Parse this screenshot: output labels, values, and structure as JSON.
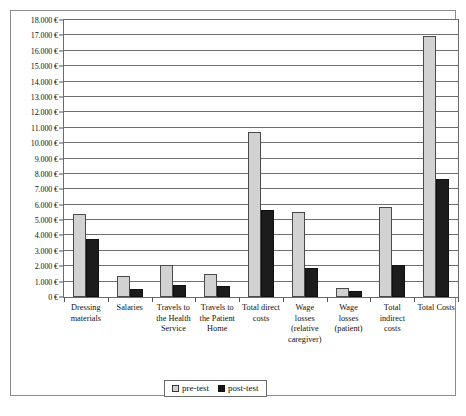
{
  "chart_data": {
    "type": "bar",
    "title": "",
    "xlabel": "",
    "ylabel": "",
    "ylim": [
      0,
      18000
    ],
    "ytick_step": 1000,
    "currency_symbol": "€",
    "grid": true,
    "legend_position": "bottom",
    "categories": [
      "Dressing\nmaterials",
      "Salaries",
      "Travels to\nthe Health\nService",
      "Travels to\nthe Patient\nHome",
      "Total direct\ncosts",
      "Wage\nlosses\n(relative\ncaregiver)",
      "Wage\nlosses\n(patient)",
      "Total\nindirect\ncosts",
      "Total Costs"
    ],
    "ytick_labels": [
      "18.000 €",
      "17.000 €",
      "16.000 €",
      "15.000 €",
      "14.000 €",
      "13.000 €",
      "12.000 €",
      "11.000 €",
      "10.000 €",
      "9.000 €",
      "8.000 €",
      "7.000 €",
      "6.000 €",
      "5.000 €",
      "4.000 €",
      "3.000 €",
      "2.000 €",
      "1.000 €",
      "0 €"
    ],
    "series": [
      {
        "name": "pre-test",
        "color": "#d2d2d2",
        "values": [
          5400,
          1350,
          2050,
          1500,
          10700,
          5500,
          580,
          5850,
          16950
        ]
      },
      {
        "name": "post-test",
        "color": "#1c1c1c",
        "values": [
          3750,
          520,
          800,
          700,
          5650,
          1900,
          400,
          2100,
          7650
        ]
      }
    ]
  },
  "legend": {
    "items": [
      {
        "label": "pre-test",
        "swatch": "light-gray-square"
      },
      {
        "label": "post-test",
        "swatch": "black-square"
      }
    ]
  }
}
